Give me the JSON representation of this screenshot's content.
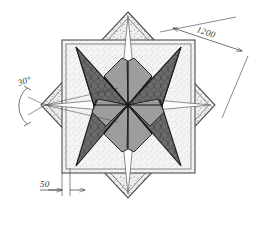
{
  "drawing": {
    "title": "Octagonal star floor pattern with six-pointed star inlay",
    "background_color": "#ffffff",
    "line_color": "#444444",
    "dimension_color": "#3b3b3b"
  },
  "dimensions": [
    {
      "id": "overall-width",
      "label": "1200",
      "position": "upper-right-diagonal",
      "unit_implied": "mm",
      "arrows": "both-ends"
    },
    {
      "id": "corner-angle",
      "label": "30°",
      "position": "left-vertex",
      "arc": true
    },
    {
      "id": "border-offset",
      "label": "50",
      "position": "bottom-left",
      "unit_implied": "mm",
      "arrows": "both-ends"
    }
  ],
  "shapes": {
    "outer_square": {
      "name": "axis-aligned-square",
      "fill": "#f2f2f2",
      "stroke": "#4a4a4a",
      "hatch": "stipple-fine"
    },
    "rotated_square": {
      "name": "diamond-square",
      "fill": "#f0f0f0",
      "stroke": "#4a4a4a",
      "hatch": "stipple-coarse",
      "rotation_deg": 45
    },
    "star_points": {
      "name": "six-point-star",
      "count": 6,
      "fill": "#6e6e6e",
      "hatch": "honeycomb",
      "stroke": "#1e1e1e"
    },
    "inner_petals": {
      "name": "center-petals",
      "count": 6,
      "fill": "#9a9a9a",
      "stroke": "#2a2a2a"
    },
    "white_spikes": {
      "name": "light-spikes",
      "count": 4,
      "fill": "#fdfdfd",
      "stroke": "#555555"
    }
  }
}
